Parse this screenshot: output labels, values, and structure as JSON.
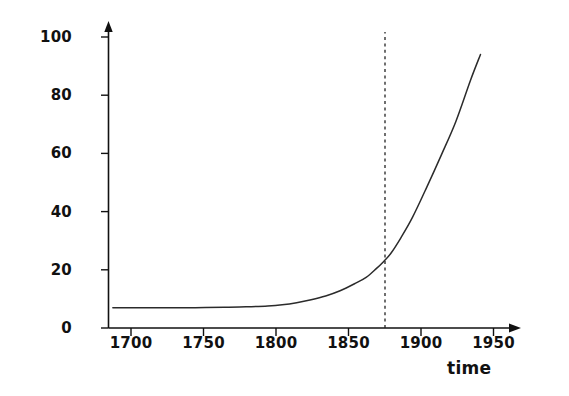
{
  "chart_data": {
    "type": "line",
    "title": "",
    "subtitle": "",
    "xlabel": "time",
    "ylabel": "observed damage/%",
    "xlim": [
      1680,
      1965
    ],
    "ylim": [
      0,
      105
    ],
    "grid": false,
    "legend": null,
    "x_ticks": [
      "1700",
      "1750",
      "1800",
      "1850",
      "1900",
      "1950"
    ],
    "x_tick_values": [
      1700,
      1750,
      1800,
      1850,
      1900,
      1950
    ],
    "y_ticks": [
      "0",
      "20",
      "40",
      "60",
      "80",
      "100"
    ],
    "y_tick_values": [
      0,
      20,
      40,
      60,
      80,
      100
    ],
    "axis_arrows": {
      "x_axis_arrow": true,
      "y_axis_arrow": true
    },
    "series": [
      {
        "name": "observed damage",
        "style": "solid",
        "color": "#2b2b2b",
        "x": [
          1683,
          1700,
          1720,
          1740,
          1760,
          1775,
          1790,
          1800,
          1810,
          1820,
          1830,
          1840,
          1850,
          1858,
          1865,
          1870,
          1875,
          1882,
          1890,
          1900,
          1910,
          1920,
          1930,
          1937
        ],
        "y": [
          7.0,
          7.0,
          7.0,
          7.0,
          7.1,
          7.3,
          7.6,
          8.0,
          8.7,
          9.7,
          11.0,
          12.8,
          15.2,
          17.4,
          20.4,
          22.8,
          25.6,
          31.0,
          38.0,
          48.5,
          59.5,
          71.0,
          85.0,
          94.0
        ]
      }
    ],
    "annotations": [
      {
        "name": "vertical-marker",
        "type": "vline",
        "x": 1875,
        "style": "dashed",
        "color": "#222222",
        "y_from": 0,
        "y_to": 102,
        "label": ""
      }
    ]
  },
  "axes": {
    "y_title": "observed damage/%",
    "x_title": "time"
  }
}
